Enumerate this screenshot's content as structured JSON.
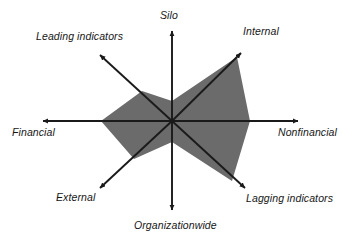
{
  "figure": {
    "kind": "radar-diagram",
    "background_color": "#ffffff",
    "axis_color": "#1a1a1a",
    "fill_color": "#6b6b6b",
    "center": {
      "x": 172,
      "y": 121
    }
  },
  "labels": {
    "silo": "Silo",
    "internal": "Internal",
    "nonfinancial": "Nonfinancial",
    "lagging_indicators": "Lagging indicators",
    "organizationwide": "Organizationwide",
    "external": "External",
    "financial": "Financial",
    "leading_indicators": "Leading indicators"
  },
  "chart_data": {
    "type": "line",
    "subtype": "radar",
    "title": "",
    "xlabel": "",
    "ylabel": "",
    "grid": false,
    "legend": "none",
    "axis_style": "arrow",
    "categories": [
      "Silo",
      "Internal",
      "Nonfinancial",
      "Lagging indicators",
      "Organizationwide",
      "External",
      "Financial",
      "Leading indicators"
    ],
    "angles_deg": [
      90,
      45,
      0,
      -45,
      -90,
      -135,
      180,
      135
    ],
    "axis_lengths_px": [
      90,
      89,
      126,
      103,
      89,
      102,
      129,
      93
    ],
    "rmax": 1.0,
    "series": [
      {
        "name": "Current profile",
        "values": [
          0.22,
          0.96,
          0.62,
          0.82,
          0.23,
          0.52,
          0.55,
          0.45
        ]
      }
    ],
    "annotations": [],
    "arrow_tips_px": {
      "Silo": {
        "x": 172,
        "y": 31
      },
      "Internal": {
        "x": 241,
        "y": 53
      },
      "Nonfinancial": {
        "x": 298,
        "y": 121
      },
      "Lagging indicators": {
        "x": 245,
        "y": 188
      },
      "Organizationwide": {
        "x": 172,
        "y": 210
      },
      "External": {
        "x": 100,
        "y": 188
      },
      "Financial": {
        "x": 43,
        "y": 121
      },
      "Leading indicators": {
        "x": 100,
        "y": 55
      }
    },
    "polygon_vertices_px": [
      {
        "axis": "Silo",
        "x": 172,
        "y": 101
      },
      {
        "axis": "Internal",
        "x": 237,
        "y": 57
      },
      {
        "axis": "Nonfinancial",
        "x": 250,
        "y": 121
      },
      {
        "axis": "Lagging indicators",
        "x": 232,
        "y": 181
      },
      {
        "axis": "Organizationwide",
        "x": 172,
        "y": 142
      },
      {
        "axis": "External",
        "x": 134,
        "y": 159
      },
      {
        "axis": "Financial",
        "x": 101,
        "y": 121
      },
      {
        "axis": "Leading indicators",
        "x": 142,
        "y": 91
      }
    ]
  }
}
